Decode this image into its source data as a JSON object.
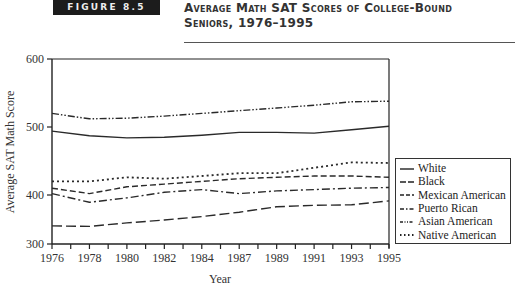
{
  "figure": {
    "badge": "FIGURE 8.5",
    "title_line1": "Average Math SAT Scores of College-Bound",
    "title_line2": "Seniors, 1976–1995"
  },
  "chart_data": {
    "type": "line",
    "title": "Average Math SAT Scores of College-Bound Seniors, 1976–1995",
    "xlabel": "Year",
    "ylabel": "Average SAT Math Score",
    "ylim": [
      300,
      600
    ],
    "yticks": [
      300,
      400,
      500,
      600
    ],
    "x_tick_labels": [
      "1976",
      "1978",
      "1980",
      "1982",
      "1984",
      "1987",
      "1989",
      "1991",
      "1993",
      "1995"
    ],
    "categories": [
      "1976",
      "1978",
      "1980",
      "1982",
      "1984",
      "1987",
      "1989",
      "1991",
      "1993",
      "1995"
    ],
    "grid": false,
    "legend_position": "right",
    "series": [
      {
        "name": "White",
        "style": "solid",
        "values": [
          494,
          487,
          484,
          485,
          488,
          492,
          492,
          491,
          496,
          501
        ]
      },
      {
        "name": "Black",
        "style": "long-dash",
        "values": [
          337,
          336,
          343,
          349,
          356,
          365,
          376,
          379,
          380,
          388
        ]
      },
      {
        "name": "Mexican American",
        "style": "dash",
        "values": [
          410,
          402,
          412,
          416,
          420,
          424,
          426,
          428,
          428,
          426
        ]
      },
      {
        "name": "Puerto Rican",
        "style": "dash-dot",
        "values": [
          402,
          385,
          394,
          404,
          408,
          402,
          406,
          408,
          410,
          411
        ]
      },
      {
        "name": "Asian American",
        "style": "dash-dot-dot",
        "values": [
          520,
          512,
          513,
          516,
          520,
          524,
          528,
          532,
          537,
          538
        ]
      },
      {
        "name": "Native American",
        "style": "dotted",
        "values": [
          420,
          420,
          426,
          424,
          428,
          432,
          432,
          440,
          448,
          447
        ]
      }
    ]
  },
  "legend": {
    "items": [
      {
        "label": "White"
      },
      {
        "label": "Black"
      },
      {
        "label": "Mexican American"
      },
      {
        "label": "Puerto Rican"
      },
      {
        "label": "Asian American"
      },
      {
        "label": "Native American"
      }
    ]
  }
}
